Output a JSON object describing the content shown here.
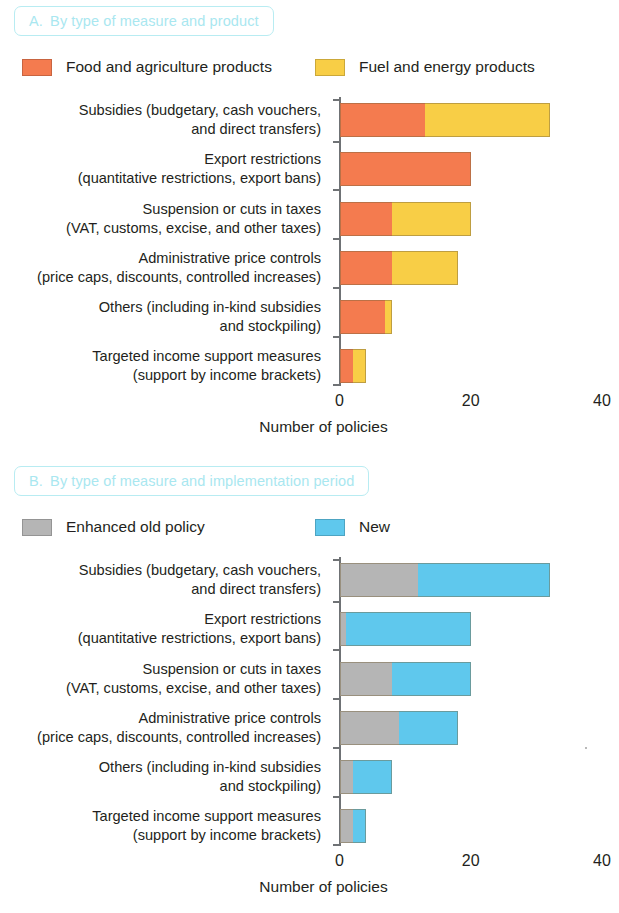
{
  "figure": {
    "axis_color": "#6f7275",
    "title_pill_border": "#b8ecf2",
    "title_pill_text_color": "#a9e7f0"
  },
  "panels": [
    {
      "id": "panel-a",
      "letter": "A.",
      "title": "By type of measure and product",
      "legend": [
        {
          "label": "Food and agriculture products",
          "color": "#F47B4F"
        },
        {
          "label": "Fuel and energy products",
          "color": "#F8CE46"
        }
      ],
      "xlabel": "Number of policies",
      "xticks": [
        "0",
        "20",
        "40"
      ]
    },
    {
      "id": "panel-b",
      "letter": "B.",
      "title": "By type of measure and implementation period",
      "legend": [
        {
          "label": "Enhanced old policy",
          "color": "#B5B5B5"
        },
        {
          "label": "New",
          "color": "#5FC8ED"
        }
      ],
      "xlabel": "Number of policies",
      "xticks": [
        "0",
        "20",
        "40"
      ]
    }
  ],
  "chart_data": [
    {
      "type": "bar",
      "orientation": "horizontal",
      "stacked": true,
      "panel": "A",
      "title": "A. By type of measure and product",
      "xlabel": "Number of policies",
      "ylabel": "",
      "xlim": [
        0,
        40
      ],
      "xticks": [
        0,
        20,
        40
      ],
      "grid": false,
      "legend_position": "top",
      "categories": [
        "Subsidies (budgetary, cash vouchers,|and direct transfers)",
        "Export restrictions|(quantitative restrictions, export bans)",
        "Suspension or cuts in taxes|(VAT, customs, excise, and other taxes)",
        "Administrative price controls|(price caps, discounts, controlled increases)",
        "Others (including in-kind subsidies|and stockpiling)",
        "Targeted income support measures|(support by income brackets)"
      ],
      "category_lines": [
        [
          "Subsidies (budgetary, cash vouchers,",
          "and direct transfers)"
        ],
        [
          "Export restrictions",
          "(quantitative restrictions, export bans)"
        ],
        [
          "Suspension or cuts in taxes",
          "(VAT, customs, excise, and other taxes)"
        ],
        [
          "Administrative price controls",
          "(price caps, discounts, controlled increases)"
        ],
        [
          "Others (including in-kind subsidies",
          "and stockpiling)"
        ],
        [
          "Targeted income support measures",
          "(support by income brackets)"
        ]
      ],
      "series": [
        {
          "name": "Food and agriculture products",
          "color": "#F47B4F",
          "values": [
            13,
            20,
            8,
            8,
            7,
            2
          ]
        },
        {
          "name": "Fuel and energy products",
          "color": "#F8CE46",
          "values": [
            19,
            0,
            12,
            10,
            1,
            2
          ]
        }
      ],
      "totals": [
        32,
        20,
        20,
        18,
        8,
        4
      ]
    },
    {
      "type": "bar",
      "orientation": "horizontal",
      "stacked": true,
      "panel": "B",
      "title": "B. By type of measure and implementation period",
      "xlabel": "Number of policies",
      "ylabel": "",
      "xlim": [
        0,
        40
      ],
      "xticks": [
        0,
        20,
        40
      ],
      "grid": false,
      "legend_position": "top",
      "categories": [
        "Subsidies (budgetary, cash vouchers,|and direct transfers)",
        "Export restrictions|(quantitative restrictions, export bans)",
        "Suspension or cuts in taxes|(VAT, customs, excise, and other taxes)",
        "Administrative price controls|(price caps, discounts, controlled increases)",
        "Others (including in-kind subsidies|and stockpiling)",
        "Targeted income support measures|(support by income brackets)"
      ],
      "category_lines": [
        [
          "Subsidies (budgetary, cash vouchers,",
          "and direct transfers)"
        ],
        [
          "Export restrictions",
          "(quantitative restrictions, export bans)"
        ],
        [
          "Suspension or cuts in taxes",
          "(VAT, customs, excise, and other taxes)"
        ],
        [
          "Administrative price controls",
          "(price caps, discounts, controlled increases)"
        ],
        [
          "Others (including in-kind subsidies",
          "and stockpiling)"
        ],
        [
          "Targeted income support measures",
          "(support by income brackets)"
        ]
      ],
      "series": [
        {
          "name": "Enhanced old policy",
          "color": "#B5B5B5",
          "values": [
            12,
            1,
            8,
            9,
            2,
            2
          ]
        },
        {
          "name": "New",
          "color": "#5FC8ED",
          "values": [
            20,
            19,
            12,
            9,
            6,
            2
          ]
        }
      ],
      "totals": [
        32,
        20,
        20,
        18,
        8,
        4
      ]
    }
  ]
}
